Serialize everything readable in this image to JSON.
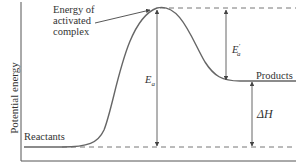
{
  "diagram": {
    "type": "energy-profile",
    "y_axis_label": "Potential energy",
    "labels": {
      "activated_complex": [
        "Energy of",
        "activated",
        "complex"
      ],
      "reactants": "Reactants",
      "products": "Products",
      "ea": "E",
      "ea_sub": "a",
      "ea_reverse": "E",
      "ea_reverse_sub": "a",
      "ea_reverse_prime": "′",
      "delta_h": "ΔH"
    },
    "levels": {
      "reactants_y": 147,
      "products_y": 81,
      "activated_complex_y": 9
    },
    "colors": {
      "line": "#555555",
      "dash": "#777777",
      "text": "#333333"
    }
  }
}
